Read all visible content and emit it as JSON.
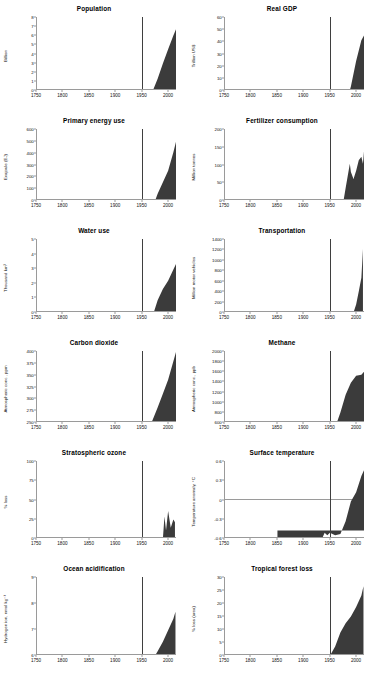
{
  "figure": {
    "accent_fill": "#3b3b3b",
    "axis_color": "#9a9a9a",
    "marker_line_color": "#3f3f3f",
    "marker_year": 1950,
    "xlim": [
      1750,
      2015
    ],
    "xticks": [
      1750,
      1800,
      1850,
      1900,
      1950,
      2000
    ],
    "caption": ""
  },
  "chart_data": [
    {
      "type": "area",
      "title": "Population",
      "ylabel": "Billion",
      "xlabel": "",
      "ylim": [
        0,
        8
      ],
      "yticks": [
        0,
        1,
        2,
        3,
        4,
        5,
        6,
        7,
        8
      ],
      "xlim": [
        1750,
        2015
      ],
      "xticks": [
        1750,
        1800,
        1850,
        1900,
        1950,
        2000
      ],
      "grid": false,
      "marker_year": 1950,
      "x": [
        1750,
        1775,
        1800,
        1825,
        1850,
        1875,
        1900,
        1910,
        1920,
        1930,
        1940,
        1950,
        1960,
        1970,
        1980,
        1990,
        2000,
        2010,
        2015
      ],
      "values": [
        0.77,
        0.83,
        0.9,
        1.0,
        1.2,
        1.32,
        1.6,
        1.75,
        1.86,
        2.07,
        2.3,
        2.53,
        3.03,
        3.7,
        4.44,
        5.32,
        6.14,
        6.93,
        7.3
      ]
    },
    {
      "type": "area",
      "title": "Real GDP",
      "ylabel": "Trillion US$",
      "xlabel": "",
      "ylim": [
        0,
        60
      ],
      "yticks": [
        0,
        10,
        20,
        30,
        40,
        50,
        60
      ],
      "xlim": [
        1750,
        2015
      ],
      "xticks": [
        1750,
        1800,
        1850,
        1900,
        1950,
        2000
      ],
      "grid": false,
      "marker_year": 1950,
      "x": [
        1750,
        1800,
        1850,
        1875,
        1900,
        1920,
        1940,
        1950,
        1960,
        1970,
        1980,
        1990,
        2000,
        2010,
        2015
      ],
      "values": [
        0.4,
        0.6,
        1.0,
        1.4,
        2.2,
        3.2,
        4.6,
        5.3,
        8.0,
        14.0,
        22.0,
        30.0,
        41.0,
        50.0,
        52.0
      ]
    },
    {
      "type": "area",
      "title": "Primary energy use",
      "ylabel": "Exajoule (EJ)",
      "xlabel": "",
      "ylim": [
        0,
        600
      ],
      "yticks": [
        0,
        100,
        200,
        300,
        400,
        500,
        600
      ],
      "xlim": [
        1750,
        2015
      ],
      "xticks": [
        1750,
        1800,
        1850,
        1900,
        1950,
        2000
      ],
      "grid": false,
      "marker_year": 1950,
      "x": [
        1750,
        1800,
        1850,
        1875,
        1900,
        1920,
        1940,
        1950,
        1960,
        1970,
        1980,
        1990,
        2000,
        2010,
        2015
      ],
      "values": [
        10,
        15,
        25,
        40,
        60,
        90,
        110,
        125,
        175,
        260,
        320,
        370,
        420,
        500,
        545
      ]
    },
    {
      "type": "area",
      "title": "Fertilizer consumption",
      "ylabel": "Million tonnes",
      "xlabel": "",
      "ylim": [
        0,
        200
      ],
      "yticks": [
        0,
        50,
        100,
        150,
        200
      ],
      "xlim": [
        1750,
        2015
      ],
      "xticks": [
        1750,
        1800,
        1850,
        1900,
        1950,
        2000
      ],
      "grid": false,
      "marker_year": 1950,
      "x": [
        1750,
        1850,
        1900,
        1920,
        1940,
        1950,
        1960,
        1970,
        1980,
        1988,
        1990,
        1995,
        2000,
        2005,
        2010,
        2013,
        2015
      ],
      "values": [
        0,
        0,
        2,
        5,
        10,
        14,
        30,
        70,
        115,
        150,
        138,
        128,
        140,
        155,
        160,
        150,
        168
      ]
    },
    {
      "type": "area",
      "title": "Water use",
      "ylabel": "Thousand km³",
      "xlabel": "",
      "ylim": [
        0,
        5
      ],
      "yticks": [
        0,
        1,
        2,
        3,
        4,
        5
      ],
      "xlim": [
        1750,
        2015
      ],
      "xticks": [
        1750,
        1800,
        1850,
        1900,
        1950,
        2000
      ],
      "grid": false,
      "marker_year": 1950,
      "x": [
        1900,
        1910,
        1920,
        1930,
        1940,
        1950,
        1960,
        1970,
        1980,
        1990,
        2000,
        2010,
        2015
      ],
      "values": [
        0.65,
        0.7,
        0.75,
        0.85,
        0.95,
        1.2,
        1.6,
        2.2,
        2.8,
        3.2,
        3.5,
        3.9,
        4.1
      ]
    },
    {
      "type": "area",
      "title": "Transportation",
      "ylabel": "Million motor vehicles",
      "xlabel": "",
      "ylim": [
        0,
        1400
      ],
      "yticks": [
        0,
        200,
        400,
        600,
        800,
        1000,
        1200,
        1400
      ],
      "xlim": [
        1750,
        2015
      ],
      "xticks": [
        1750,
        1800,
        1850,
        1900,
        1950,
        2000
      ],
      "grid": false,
      "marker_year": 1950,
      "x": [
        1950,
        1960,
        1965,
        1970,
        1975,
        1980,
        1985,
        1990,
        1995,
        2000,
        2005,
        2010,
        2013
      ],
      "values": [
        70,
        125,
        180,
        250,
        330,
        420,
        500,
        600,
        660,
        740,
        870,
        1010,
        1300
      ]
    },
    {
      "type": "area",
      "title": "Carbon dioxide",
      "ylabel": "Atmospheric conc., ppm",
      "xlabel": "",
      "ylim": [
        250,
        400
      ],
      "yticks": [
        250,
        275,
        300,
        325,
        350,
        375,
        400
      ],
      "xlim": [
        1750,
        2015
      ],
      "xticks": [
        1750,
        1800,
        1850,
        1900,
        1950,
        2000
      ],
      "grid": false,
      "marker_year": 1950,
      "x": [
        1750,
        1800,
        1825,
        1850,
        1875,
        1900,
        1920,
        1940,
        1950,
        1960,
        1970,
        1980,
        1990,
        2000,
        2010,
        2015
      ],
      "values": [
        277,
        281,
        283,
        285,
        287,
        296,
        302,
        310,
        311,
        317,
        325,
        339,
        354,
        369,
        389,
        399
      ]
    },
    {
      "type": "area",
      "title": "Methane",
      "ylabel": "Atmospheric conc., ppb",
      "xlabel": "",
      "ylim": [
        600,
        2000
      ],
      "yticks": [
        600,
        800,
        1000,
        1200,
        1400,
        1600,
        1800,
        2000
      ],
      "xlim": [
        1750,
        2015
      ],
      "xticks": [
        1750,
        1800,
        1850,
        1900,
        1950,
        2000
      ],
      "grid": false,
      "marker_year": 1950,
      "x": [
        1750,
        1800,
        1850,
        1875,
        1900,
        1920,
        1940,
        1950,
        1960,
        1970,
        1980,
        1990,
        2000,
        2010,
        2015
      ],
      "values": [
        690,
        700,
        730,
        760,
        830,
        900,
        1030,
        1120,
        1230,
        1380,
        1560,
        1680,
        1750,
        1760,
        1790
      ]
    },
    {
      "type": "area",
      "title": "Stratospheric ozone",
      "ylabel": "% loss",
      "xlabel": "",
      "ylim": [
        0,
        100
      ],
      "yticks": [
        0,
        25,
        50,
        75,
        100
      ],
      "xlim": [
        1750,
        2015
      ],
      "xticks": [
        1750,
        1800,
        1850,
        1900,
        1950,
        2000
      ],
      "grid": false,
      "marker_year": 1950,
      "x": [
        1955,
        1960,
        1965,
        1970,
        1975,
        1980,
        1985,
        1990,
        1993,
        1996,
        2000,
        2005,
        2010,
        2013
      ],
      "values": [
        1,
        2,
        3,
        4,
        6,
        12,
        28,
        44,
        60,
        50,
        64,
        52,
        58,
        56
      ]
    },
    {
      "type": "area",
      "title": "Surface temperature",
      "ylabel": "Temperature anomaly, °C",
      "xlabel": "",
      "ylim": [
        -0.6,
        0.6
      ],
      "yticks": [
        0.6,
        0.3,
        0.0,
        -0.3,
        -0.6
      ],
      "xlim": [
        1750,
        2015
      ],
      "xticks": [
        1750,
        1800,
        1850,
        1900,
        1950,
        2000
      ],
      "grid": false,
      "marker_year": 1950,
      "baseline": 0,
      "x": [
        1850,
        1860,
        1870,
        1880,
        1890,
        1900,
        1910,
        1920,
        1930,
        1940,
        1945,
        1950,
        1960,
        1970,
        1980,
        1990,
        2000,
        2010,
        2015
      ],
      "values": [
        -0.18,
        -0.25,
        -0.22,
        -0.26,
        -0.34,
        -0.24,
        -0.38,
        -0.22,
        -0.12,
        -0.02,
        -0.04,
        -0.02,
        -0.04,
        -0.03,
        0.08,
        0.25,
        0.33,
        0.47,
        0.52
      ]
    },
    {
      "type": "area",
      "title": "Ocean acidification",
      "ylabel": "Hydrogen ion, nmol kg⁻¹",
      "xlabel": "",
      "ylim": [
        6,
        9
      ],
      "yticks": [
        6,
        7,
        8,
        9
      ],
      "xlim": [
        1750,
        2015
      ],
      "xticks": [
        1750,
        1800,
        1850,
        1900,
        1950,
        2000
      ],
      "grid": false,
      "marker_year": 1950,
      "x": [
        1850,
        1870,
        1890,
        1900,
        1920,
        1940,
        1950,
        1960,
        1970,
        1980,
        1990,
        2000,
        2010,
        2014
      ],
      "values": [
        6.55,
        6.6,
        6.65,
        6.7,
        6.78,
        6.9,
        7.0,
        7.05,
        7.2,
        7.4,
        7.6,
        7.85,
        8.1,
        8.25
      ]
    },
    {
      "type": "area",
      "title": "Tropical forest loss",
      "ylabel": "% loss (area)",
      "xlabel": "",
      "ylim": [
        0,
        30
      ],
      "yticks": [
        0,
        5,
        10,
        15,
        20,
        25,
        30
      ],
      "xlim": [
        1750,
        2015
      ],
      "xticks": [
        1750,
        1800,
        1850,
        1900,
        1950,
        2000
      ],
      "grid": false,
      "marker_year": 1950,
      "x": [
        1750,
        1800,
        1850,
        1875,
        1900,
        1920,
        1940,
        1950,
        1960,
        1970,
        1980,
        1990,
        2000,
        2010,
        2014
      ],
      "values": [
        0.8,
        1.6,
        3.0,
        4.5,
        6.5,
        9.0,
        11.5,
        13.0,
        15.0,
        18.0,
        20.0,
        21.5,
        23.5,
        26.0,
        28.0
      ]
    }
  ]
}
